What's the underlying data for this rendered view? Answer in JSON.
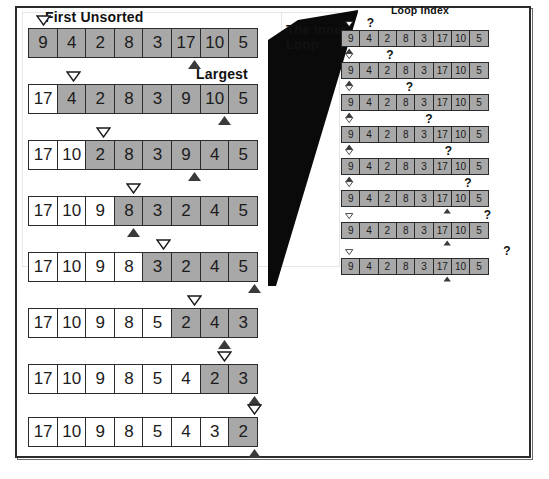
{
  "figure": {
    "title_label_first_unsorted": "First Unsorted",
    "title_label_largest": "Largest",
    "title_label_loop_index": "Loop Index",
    "callout_text": "The Inner Loop",
    "question_mark": "?",
    "colors": {
      "shaded_cell": "#a8a8a8",
      "plain_cell": "#ffffff",
      "border": "#2b2b2b",
      "wedge": "#0a0a0a",
      "text": "#1b1b1b"
    }
  },
  "outer_pass_rows": [
    {
      "values": [
        "9",
        "4",
        "2",
        "8",
        "3",
        "17",
        "10",
        "5"
      ],
      "shaded_from": 0,
      "first_unsorted_index": 0,
      "largest_index": 5
    },
    {
      "values": [
        "17",
        "4",
        "2",
        "8",
        "3",
        "9",
        "10",
        "5"
      ],
      "shaded_from": 1,
      "first_unsorted_index": 1,
      "largest_index": 6
    },
    {
      "values": [
        "17",
        "10",
        "2",
        "8",
        "3",
        "9",
        "4",
        "5"
      ],
      "shaded_from": 2,
      "first_unsorted_index": 2,
      "largest_index": 5
    },
    {
      "values": [
        "17",
        "10",
        "9",
        "8",
        "3",
        "2",
        "4",
        "5"
      ],
      "shaded_from": 3,
      "first_unsorted_index": 3,
      "largest_index": 3
    },
    {
      "values": [
        "17",
        "10",
        "9",
        "8",
        "3",
        "2",
        "4",
        "5"
      ],
      "shaded_from": 4,
      "first_unsorted_index": 4,
      "largest_index": 7
    },
    {
      "values": [
        "17",
        "10",
        "9",
        "8",
        "5",
        "2",
        "4",
        "3"
      ],
      "shaded_from": 5,
      "first_unsorted_index": 5,
      "largest_index": 6
    },
    {
      "values": [
        "17",
        "10",
        "9",
        "8",
        "5",
        "4",
        "2",
        "3"
      ],
      "shaded_from": 6,
      "first_unsorted_index": 6,
      "largest_index": 7
    },
    {
      "values": [
        "17",
        "10",
        "9",
        "8",
        "5",
        "4",
        "3",
        "2"
      ],
      "shaded_from": 7,
      "first_unsorted_index": 7,
      "largest_index": 7
    }
  ],
  "inner_loop_rows": [
    {
      "values": [
        "9",
        "4",
        "2",
        "8",
        "3",
        "17",
        "10",
        "5"
      ],
      "loop_index": 1,
      "largest_index": 0,
      "first_unsorted_index": 0
    },
    {
      "values": [
        "9",
        "4",
        "2",
        "8",
        "3",
        "17",
        "10",
        "5"
      ],
      "loop_index": 2,
      "largest_index": 0,
      "first_unsorted_index": 0
    },
    {
      "values": [
        "9",
        "4",
        "2",
        "8",
        "3",
        "17",
        "10",
        "5"
      ],
      "loop_index": 3,
      "largest_index": 0,
      "first_unsorted_index": 0
    },
    {
      "values": [
        "9",
        "4",
        "2",
        "8",
        "3",
        "17",
        "10",
        "5"
      ],
      "loop_index": 4,
      "largest_index": 0,
      "first_unsorted_index": 0
    },
    {
      "values": [
        "9",
        "4",
        "2",
        "8",
        "3",
        "17",
        "10",
        "5"
      ],
      "loop_index": 5,
      "largest_index": 0,
      "first_unsorted_index": 0
    },
    {
      "values": [
        "9",
        "4",
        "2",
        "8",
        "3",
        "17",
        "10",
        "5"
      ],
      "loop_index": 6,
      "largest_index": 5,
      "first_unsorted_index": 0
    },
    {
      "values": [
        "9",
        "4",
        "2",
        "8",
        "3",
        "17",
        "10",
        "5"
      ],
      "loop_index": 7,
      "largest_index": 5,
      "first_unsorted_index": 0
    },
    {
      "values": [
        "9",
        "4",
        "2",
        "8",
        "3",
        "17",
        "10",
        "5"
      ],
      "loop_index": 8,
      "largest_index": 5,
      "first_unsorted_index": 0
    }
  ],
  "geometry": {
    "left_row_tops": [
      28,
      84,
      140,
      196,
      252,
      308,
      364,
      417
    ],
    "right_row_tops": [
      30,
      62,
      94,
      126,
      158,
      190,
      222,
      258
    ],
    "left_cell_width": 30.2,
    "right_cell_width": 19.5,
    "left_left": 28,
    "right_left": 341
  }
}
